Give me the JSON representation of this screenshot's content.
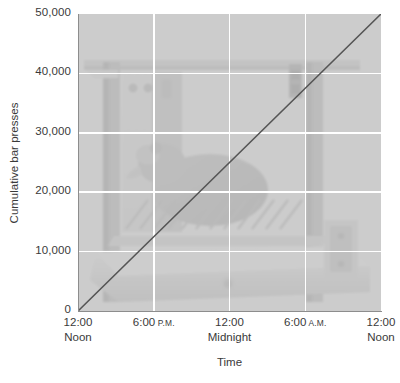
{
  "chart_data": {
    "type": "line",
    "title": "",
    "xlabel": "Time",
    "ylabel": "Cumulative bar presses",
    "grid": true,
    "legend": "none",
    "background_image": "operant-conditioning-chamber-photo",
    "ylim": [
      0,
      50000
    ],
    "yticks": [
      {
        "value": 0,
        "label": "0"
      },
      {
        "value": 10000,
        "label": "10,000"
      },
      {
        "value": 20000,
        "label": "20,000"
      },
      {
        "value": 30000,
        "label": "30,000"
      },
      {
        "value": 40000,
        "label": "40,000"
      },
      {
        "value": 50000,
        "label": "50,000"
      }
    ],
    "xlim": [
      0,
      24
    ],
    "xticks": [
      {
        "value": 0,
        "line1": "12:00",
        "line2": "Noon",
        "suffix": ""
      },
      {
        "value": 6,
        "line1": "6:00",
        "line2": "",
        "suffix": "P.M."
      },
      {
        "value": 12,
        "line1": "12:00",
        "line2": "Midnight",
        "suffix": ""
      },
      {
        "value": 18,
        "line1": "6:00",
        "line2": "",
        "suffix": "A.M."
      },
      {
        "value": 24,
        "line1": "12:00",
        "line2": "Noon",
        "suffix": ""
      }
    ],
    "series": [
      {
        "name": "Cumulative bar presses",
        "color": "#555555",
        "x": [
          0,
          6,
          12,
          18,
          24
        ],
        "values": [
          0,
          12500,
          25000,
          37500,
          50000
        ]
      }
    ],
    "colors": {
      "plot_background": "#dcdcdc",
      "gridline": "#ffffff",
      "axis": "#8d8d8d",
      "line": "#555555",
      "text": "#3a3a3a",
      "page_background": "#ffffff"
    }
  }
}
